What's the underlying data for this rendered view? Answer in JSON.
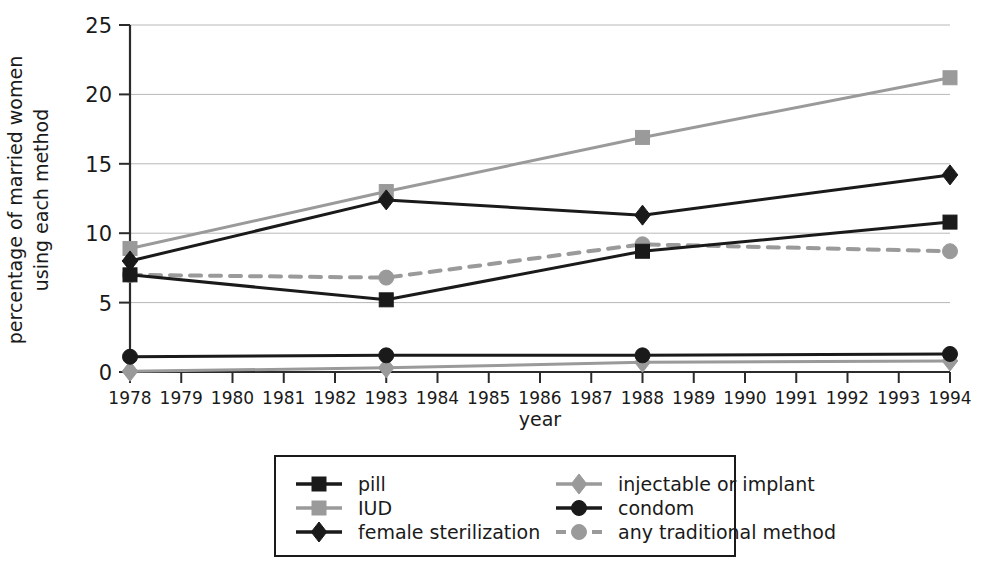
{
  "chart_data": {
    "type": "line",
    "title": "",
    "xlabel": "year",
    "ylabel_line1": "percentage of married women",
    "ylabel_line2": "using each method",
    "x": [
      1978,
      1983,
      1988,
      1994
    ],
    "xlim": [
      1978,
      1994
    ],
    "ylim": [
      0,
      25
    ],
    "yticks": [
      0,
      5,
      10,
      15,
      20,
      25
    ],
    "xticks": [
      1978,
      1979,
      1980,
      1981,
      1982,
      1983,
      1984,
      1985,
      1986,
      1987,
      1988,
      1989,
      1990,
      1991,
      1992,
      1993,
      1994
    ],
    "xtick_labels": [
      "1978",
      "1979",
      "1980",
      "1981",
      "1982",
      "1983",
      "1984",
      "1985",
      "1986",
      "1987",
      "1988",
      "1989",
      "1990",
      "1991",
      "1992",
      "1993",
      "1994"
    ],
    "ytick_labels": [
      "0",
      "5",
      "10",
      "15",
      "20",
      "25"
    ],
    "grid": true,
    "legend_position": "below",
    "series": [
      {
        "name": "pill",
        "values": [
          7.0,
          5.2,
          8.7,
          10.8
        ],
        "color": "#1a1a1a",
        "marker": "square",
        "dash": "none"
      },
      {
        "name": "IUD",
        "values": [
          8.9,
          13.0,
          16.9,
          21.2
        ],
        "color": "#9a9a9a",
        "marker": "square",
        "dash": "none"
      },
      {
        "name": "female sterilization",
        "values": [
          8.0,
          12.4,
          11.3,
          14.2
        ],
        "color": "#1a1a1a",
        "marker": "diamond",
        "dash": "none"
      },
      {
        "name": "injectable or implant",
        "values": [
          0.05,
          0.3,
          0.7,
          0.8
        ],
        "color": "#9a9a9a",
        "marker": "diamond",
        "dash": "none"
      },
      {
        "name": "condom",
        "values": [
          1.1,
          1.2,
          1.2,
          1.3
        ],
        "color": "#1a1a1a",
        "marker": "circle",
        "dash": "none"
      },
      {
        "name": "any traditional method",
        "values": [
          7.0,
          6.8,
          9.2,
          8.7
        ],
        "color": "#9a9a9a",
        "marker": "circle",
        "dash": "dashed"
      }
    ],
    "legend_entries": [
      {
        "label": "pill",
        "color": "#1a1a1a",
        "marker": "square",
        "dash": "none",
        "column": 0,
        "row": 0
      },
      {
        "label": "IUD",
        "color": "#9a9a9a",
        "marker": "square",
        "dash": "none",
        "column": 0,
        "row": 1
      },
      {
        "label": "female sterilization",
        "color": "#1a1a1a",
        "marker": "diamond",
        "dash": "none",
        "column": 0,
        "row": 2
      },
      {
        "label": "injectable or implant",
        "color": "#9a9a9a",
        "marker": "diamond",
        "dash": "none",
        "column": 1,
        "row": 0
      },
      {
        "label": "condom",
        "color": "#1a1a1a",
        "marker": "circle",
        "dash": "none",
        "column": 1,
        "row": 1
      },
      {
        "label": "any traditional method",
        "color": "#9a9a9a",
        "marker": "circle",
        "dash": "dashed",
        "column": 1,
        "row": 2
      }
    ]
  }
}
